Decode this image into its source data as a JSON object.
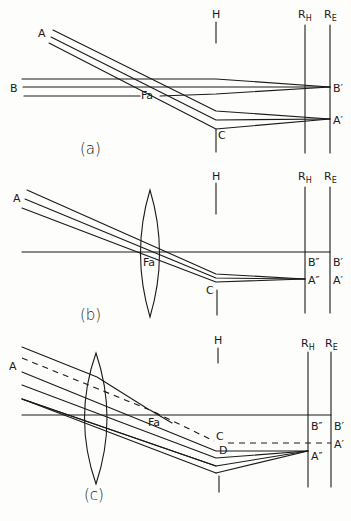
{
  "figure": {
    "panels": [
      {
        "id": "a",
        "caption": "(a)",
        "labels": {
          "object_a": "A",
          "object_b": "B",
          "focal": "Fa",
          "h_marker": "H",
          "retina_h": "R",
          "retina_h_sub": "H",
          "retina_e": "R",
          "retina_e_sub": "E",
          "image_b": "B′",
          "image_a": "A′",
          "point_c": "C"
        }
      },
      {
        "id": "b",
        "caption": "(b)",
        "labels": {
          "object_a": "A",
          "focal": "Fa",
          "h_marker": "H",
          "retina_h": "R",
          "retina_h_sub": "H",
          "retina_e": "R",
          "retina_e_sub": "E",
          "image_b2": "B″",
          "image_b": "B′",
          "image_a2": "A″",
          "image_a": "A′",
          "point_c": "C"
        }
      },
      {
        "id": "c",
        "caption": "(c)",
        "labels": {
          "object_a": "A",
          "focal": "Fa",
          "h_marker": "H",
          "retina_h": "R",
          "retina_h_sub": "H",
          "retina_e": "R",
          "retina_e_sub": "E",
          "image_b2": "B″",
          "image_b": "B′",
          "image_a2": "A″",
          "image_a": "A′",
          "point_c": "C",
          "point_d": "D"
        }
      }
    ],
    "colors": {
      "ink": "#1a1a1a",
      "paper": "#fdfdfb"
    }
  }
}
